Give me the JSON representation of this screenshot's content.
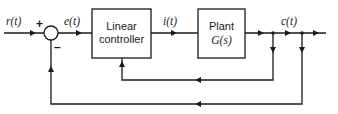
{
  "diagram": {
    "type": "control-system-block-diagram",
    "signals": {
      "input": "r(t)",
      "error": "e(t)",
      "control": "i(t)",
      "output": "c(t)"
    },
    "summing_junction": {
      "plus_sign": "+",
      "minus_sign": "–"
    },
    "blocks": {
      "controller": {
        "line1": "Linear",
        "line2": "controller"
      },
      "plant": {
        "line1": "Plant",
        "line2": "G(s)"
      }
    },
    "feedback_paths": [
      {
        "name": "inner",
        "from": "c(t)",
        "to": "Linear controller"
      },
      {
        "name": "outer",
        "from": "c(t)",
        "to": "summing junction"
      }
    ],
    "colors": {
      "ink": "#1a1a1a",
      "background": "#ffffff"
    }
  }
}
